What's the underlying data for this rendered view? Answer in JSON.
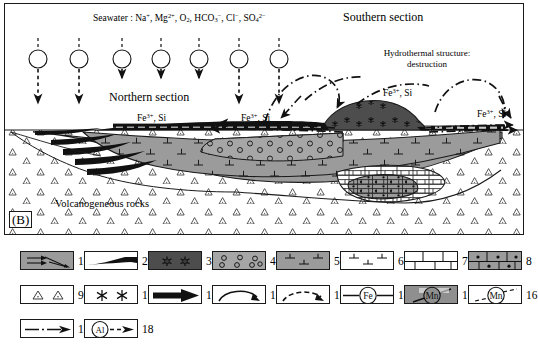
{
  "panel": {
    "label": "(B)"
  },
  "diagram": {
    "seawater_label": "Seawater :",
    "seawater_species": [
      "Na+",
      "Mg2+",
      "O2",
      "HCO3-",
      "Cl-",
      "SO42-"
    ],
    "seawater_text": "Seawater : Na+, Mg2+, O2, HCO3−, Cl−, SO42−",
    "northern_section": "Northern section",
    "southern_section": "Southern section",
    "hydrothermal_line1": "Hydrothermal structure:",
    "hydrothermal_line2": "destruction",
    "volcanogeneous_rocks": "Volcanogeneous rocks",
    "fesi_label": "Fe3+, Si",
    "fesi_labels": [
      {
        "id": "fesi-left",
        "x": 137,
        "y": 114
      },
      {
        "id": "fesi-center",
        "x": 241,
        "y": 114
      },
      {
        "id": "fesi-upper-right",
        "x": 385,
        "y": 95
      },
      {
        "id": "fesi-far-right",
        "x": 478,
        "y": 112
      }
    ],
    "al_symbol": "Al",
    "al_sources": [
      {
        "x": 33,
        "y": 55,
        "arrow_bottom": 103
      },
      {
        "x": 74,
        "y": 55,
        "arrow_bottom": 103
      },
      {
        "x": 117,
        "y": 55,
        "arrow_bottom": 78
      },
      {
        "x": 156,
        "y": 55,
        "arrow_bottom": 78
      },
      {
        "x": 194,
        "y": 55,
        "arrow_bottom": 78
      },
      {
        "x": 234,
        "y": 55,
        "arrow_bottom": 103
      },
      {
        "x": 274,
        "y": 55,
        "arrow_bottom": 103
      }
    ],
    "colors": {
      "ore_gray": "#9b9b9b",
      "dark_gray": "#4a4a4a",
      "black": "#111111",
      "light_gray": "#bdbdbd",
      "white": "#ffffff",
      "outline": "#1a1a1a"
    }
  },
  "legend": {
    "items": [
      {
        "n": "1",
        "symbol": "gray-box-arrows",
        "desc": "gray field with fine arrows"
      },
      {
        "n": "2",
        "symbol": "white-box-black-wedge",
        "desc": "white box with black wedge lens"
      },
      {
        "n": "3",
        "symbol": "dark-gray-box-asterisks",
        "desc": "dark gray with asterisk symbols"
      },
      {
        "n": "4",
        "symbol": "gray-box-circles",
        "desc": "gray with small open circles"
      },
      {
        "n": "5",
        "symbol": "gray-box-tees",
        "desc": "gray with perpendicular tee marks"
      },
      {
        "n": "6",
        "symbol": "white-box-tees",
        "desc": "white with perpendicular tee marks"
      },
      {
        "n": "7",
        "symbol": "white-brick",
        "desc": "white brick pattern"
      },
      {
        "n": "8",
        "symbol": "gray-brick-dots",
        "desc": "gray brick pattern with dots"
      },
      {
        "n": "9",
        "symbol": "white-box-triangles",
        "desc": "white with small triangles"
      },
      {
        "n": "10",
        "symbol": "white-box-asterisks",
        "desc": "white with asterisks"
      },
      {
        "n": "11",
        "symbol": "solid-black-arrow",
        "desc": "thick solid black arrow"
      },
      {
        "n": "12",
        "symbol": "curved-arrow",
        "desc": "curved solid arrow"
      },
      {
        "n": "13",
        "symbol": "dashed-curved-arrow",
        "desc": "dashed curved arrow"
      },
      {
        "n": "14",
        "symbol": "fe-circle-line",
        "desc": "line through circled Fe"
      },
      {
        "n": "15",
        "symbol": "mn-circle-gray",
        "desc": "circled Mn on gray with slash"
      },
      {
        "n": "16",
        "symbol": "mn-circle-white",
        "desc": "circled Mn on white dashed"
      },
      {
        "n": "17",
        "symbol": "dash-dot-arrow",
        "desc": "dash-dot line with arrowhead"
      },
      {
        "n": "18",
        "symbol": "al-circle-dash-arrow",
        "desc": "circled Al with dashed arrow"
      }
    ],
    "fe_label": "Fe",
    "mn_label": "Mn",
    "al_label": "Al"
  }
}
